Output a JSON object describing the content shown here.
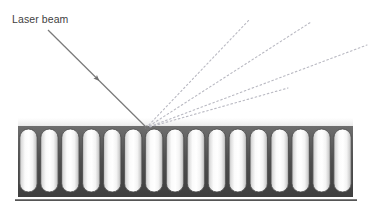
{
  "figure": {
    "background_color": "#ffffff"
  },
  "annotations": {
    "laser_beam_label": "Laser beam"
  },
  "icons": {
    "incident_beam": "arrow-down-right-icon",
    "scattered_rays": "dotted-ray-icon"
  },
  "colors": {
    "incident_beam": "#7a7a7a",
    "scattered_ray": "#b9b9c2",
    "rod_outline": "#4a4a4a",
    "rod_fill_light": "#ffffff",
    "rod_fill_shade": "#c9c9c9",
    "substrate_dark": "#535353",
    "substrate_band": "#d6d6d6",
    "baseline": "#555555",
    "label_text": "#3f3f3f"
  },
  "incident_beam": {
    "label": "Laser beam",
    "start": {
      "x": 48,
      "y": 30
    },
    "end": {
      "x": 146,
      "y": 127
    },
    "stroke_width": 1.2,
    "arrowheads": [
      {
        "x": 96,
        "y": 78
      },
      {
        "x": 146,
        "y": 127
      }
    ]
  },
  "scattered_rays": {
    "origin": {
      "x": 146,
      "y": 128
    },
    "dash_pattern": "1.6 2.6",
    "stroke_width": 1.1,
    "endpoints": [
      {
        "x": 250,
        "y": 19
      },
      {
        "x": 311,
        "y": 22
      },
      {
        "x": 367,
        "y": 45
      },
      {
        "x": 288,
        "y": 88
      }
    ]
  },
  "substrate": {
    "left": 18,
    "right": 353,
    "top": 126,
    "rod_top": 129,
    "rod_bottom": 192,
    "block_bottom": 197,
    "rod_count": 16,
    "rod_width": 17.5,
    "rod_gap": 3.4,
    "band_top": 120,
    "baseline": {
      "x1": 15,
      "x2": 357,
      "y": 200,
      "stroke_width": 1.6
    }
  }
}
